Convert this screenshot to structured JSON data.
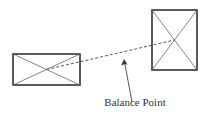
{
  "diagram": {
    "label": "Balance Point",
    "colors": {
      "stroke": "#333333",
      "diagonal": "#666666",
      "background": "#ffffff"
    },
    "shapes": [
      {
        "name": "left-box",
        "x": 13,
        "y": 54,
        "width": 67,
        "height": 31,
        "crossed": true
      },
      {
        "name": "right-box",
        "x": 152,
        "y": 10,
        "width": 45,
        "height": 60,
        "crossed": true
      }
    ],
    "connector": {
      "style": "dashed",
      "from": [
        46.5,
        69.5
      ],
      "to": [
        174.5,
        40
      ]
    },
    "arrow": {
      "from": [
        132,
        102
      ],
      "to": [
        124,
        60
      ]
    }
  }
}
